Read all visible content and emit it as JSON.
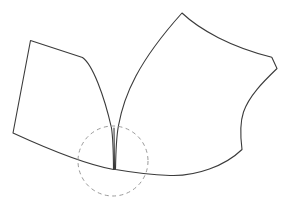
{
  "figure": {
    "background_color": "#ffffff",
    "width": 283,
    "height": 207,
    "stroke_color": "#3b3b3b",
    "stroke_width": 1.1,
    "highlight_color": "#9a9a9a",
    "highlight_dash": "4 3.4"
  },
  "shapes": {
    "left_patch": {
      "name": "left-patch",
      "label": "Left patch outline",
      "path": "M 30.5 40.5 L 82.5 57.5 C 92.5 64.5 104.0 95.0 111.5 128.0 C 113.0 138.0 113.4 152.0 113.5 169.5 L 113.5 169.5 C 86.0 164.5 50.0 150.0 13.0 133.0 L 30.5 40.5 Z"
    },
    "right_patch": {
      "name": "right-patch",
      "label": "Right patch outline",
      "path": "M 115.5 169.5 C 115.8 150.0 116.6 136.0 118.4 126.0 C 124.0 95.0 138.0 62.0 182.0 13.0 C 200.0 30.0 231.0 47.0 271.8 57.2 L 277.0 68.5 C 263.0 82.0 249.0 96.0 243.5 112.0 C 239.5 124.0 240.5 138.0 242.0 149.5 C 225.0 166.0 196.0 176.5 170.0 175.5 C 148.0 174.6 130.0 172.0 115.5 169.5 Z"
    },
    "seam": {
      "name": "seam-line",
      "label": "Vertical seam between patches",
      "path": "M 114.5 169.5 L 114.0 128.0"
    },
    "highlight": {
      "name": "singularity-highlight",
      "label": "Dashed circle marking the singular point",
      "cx": 113,
      "cy": 161,
      "r": 35
    }
  },
  "annotations": {
    "corner_points": [
      {
        "name": "left-top-corner",
        "x": 30.5,
        "y": 40.5
      },
      {
        "name": "left-upper-break",
        "x": 82.5,
        "y": 57.5
      },
      {
        "name": "left-bottom-corner",
        "x": 13.0,
        "y": 133.0
      },
      {
        "name": "right-apex",
        "x": 182.0,
        "y": 13.0
      },
      {
        "name": "right-notch-top",
        "x": 271.8,
        "y": 57.2
      },
      {
        "name": "right-notch-bottom",
        "x": 277.0,
        "y": 68.5
      },
      {
        "name": "seam-point",
        "x": 114.0,
        "y": 169.5
      }
    ]
  }
}
